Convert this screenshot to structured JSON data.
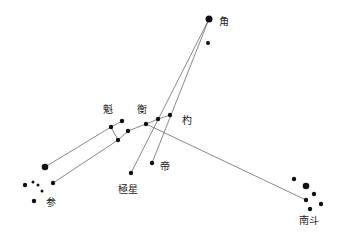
{
  "labels": {
    "jiao": "角",
    "kui": "魁",
    "heng": "衡",
    "shao": "杓",
    "di": "帝",
    "jixing": "極星",
    "shen": "参",
    "nandou": "南斗"
  },
  "groups": [
    {
      "name": "jiao",
      "label": "角",
      "star_count": 2
    },
    {
      "name": "big-dipper",
      "labels": [
        "魁",
        "衡",
        "杓"
      ],
      "star_count": 7
    },
    {
      "name": "di",
      "label": "帝",
      "star_count": 1
    },
    {
      "name": "jixing",
      "label": "極星",
      "star_count": 1
    },
    {
      "name": "shen",
      "label": "参",
      "star_count": 7
    },
    {
      "name": "nandou",
      "label": "南斗",
      "star_count": 6
    }
  ],
  "connections": [
    {
      "from": "jiao",
      "to": "jixing"
    },
    {
      "from": "jiao",
      "to": "di"
    },
    {
      "from": "big-dipper-kui",
      "to": "shen"
    },
    {
      "from": "big-dipper-kui",
      "to": "shen-lower"
    },
    {
      "from": "big-dipper-heng",
      "to": "nandou"
    }
  ],
  "colors": {
    "star": "#111111",
    "line": "#555555",
    "background": "#ffffff"
  }
}
